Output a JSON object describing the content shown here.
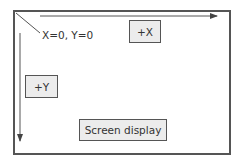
{
  "diagram": {
    "origin_label": "X=0, Y=0",
    "x_axis_box_label": "+X",
    "y_axis_box_label": "+Y",
    "screen_box_label": "Screen display",
    "colors": {
      "frame": "#555555",
      "box_fill": "#ececec",
      "text": "#333333",
      "background": "#ffffff"
    }
  }
}
